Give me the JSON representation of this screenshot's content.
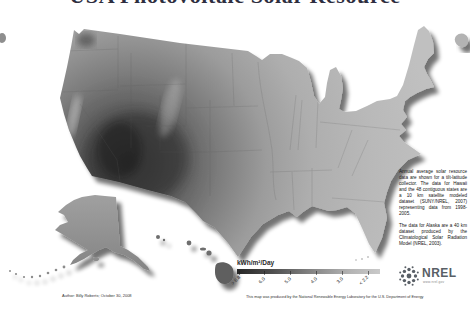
{
  "title": "USA Photovoltaic Solar Resource",
  "legend": {
    "unit_label": "kWh/m²/Day",
    "ticks": [
      "> 6.8",
      "6.0",
      "5.0",
      "4.0",
      "3.0",
      "< 2.2"
    ],
    "high_color": "#262626",
    "low_color": "#c9c9c9"
  },
  "annotations": {
    "data_note_1": "Annual average solar resource data are shown for a tilt-latitude collector. The data for Hawaii and the 48 contiguous states are a 10 km satellite modeled dataset (SUNY/NREL, 2007) representing data from 1998-2005.",
    "data_note_2": "The data for Alaska are a 40 km dataset produced by the Climatological Solar Radiation Model (NREL, 2003)."
  },
  "credits": {
    "author_line": "Author: Billy Roberts; October 30, 2008",
    "produced_line": "This map was produced by the National Renewable Energy Laboratory for the U.S. Department of Energy"
  },
  "logo": {
    "wordmark": "NREL",
    "website": "www.nrel.gov",
    "icon": "nrel-sun-icon",
    "color": "#595f66"
  },
  "map": {
    "regions": [
      "Contiguous United States",
      "Alaska",
      "Hawaii"
    ],
    "dark_shade": "#3e3e3e",
    "light_shade": "#c0c0c0",
    "shading_note": "dark = high solar resource (Southwest), light = low resource"
  }
}
